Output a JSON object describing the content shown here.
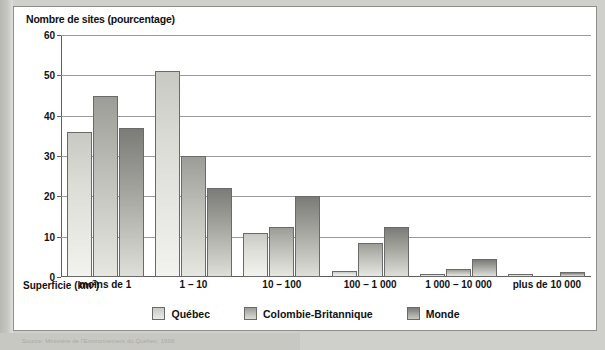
{
  "figure": {
    "title": "Nombre de sites (pourcentage)",
    "xaxis_title_main": "Superficie (km",
    "xaxis_title_sup": "2",
    "xaxis_title_close": ")",
    "source": "Source: Ministère de l'Environnement du Québec, 1999"
  },
  "legend": {
    "position": "bottom-center",
    "items": [
      {
        "label": "Québec",
        "color": "#e2e2de",
        "series_index": 0
      },
      {
        "label": "Colombie-Britannique",
        "color": "#b5b5b0",
        "series_index": 1
      },
      {
        "label": "Monde",
        "color": "#939390",
        "series_index": 2
      }
    ]
  },
  "chart_data": {
    "type": "bar",
    "title": "Nombre de sites (pourcentage)",
    "xlabel": "Superficie (km2)",
    "ylabel": "Nombre de sites (pourcentage)",
    "ylim": [
      0,
      60
    ],
    "yticks": [
      0,
      10,
      20,
      30,
      40,
      50,
      60
    ],
    "grid": true,
    "grid_axis": "y",
    "categories": [
      "moins de 1",
      "1 – 10",
      "10 – 100",
      "100 – 1 000",
      "1 000 – 10 000",
      "plus de 10 000"
    ],
    "series": [
      {
        "name": "Québec",
        "color": "#e2e2de",
        "values": [
          36,
          51,
          11,
          1.5,
          0.8,
          0.7
        ]
      },
      {
        "name": "Colombie-Britannique",
        "color": "#b5b5b0",
        "values": [
          45,
          30,
          12.5,
          8.5,
          2,
          0
        ]
      },
      {
        "name": "Monde",
        "color": "#939390",
        "values": [
          37,
          22,
          20,
          12.5,
          4.5,
          1.3
        ]
      }
    ]
  }
}
